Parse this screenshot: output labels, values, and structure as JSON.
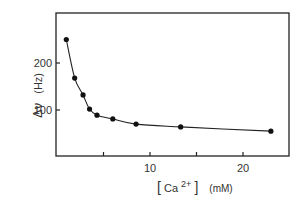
{
  "chart_data": {
    "type": "line",
    "title": "",
    "xlabel": "[Ca2+] (mM)",
    "ylabel": "Δν (Hz)",
    "x_label_parts": {
      "bracket_open": "[",
      "species": "Ca",
      "charge": "2+",
      "bracket_close": "]",
      "unit": "(mM)"
    },
    "y_label_parts": {
      "symbol": "Δν",
      "unit": "(Hz)"
    },
    "xlim": [
      0,
      25
    ],
    "ylim": [
      0,
      305
    ],
    "x_ticks": [
      5,
      10,
      15,
      20
    ],
    "x_tick_labels": [
      "10",
      "20"
    ],
    "x_tick_label_values": [
      10,
      20
    ],
    "y_ticks": [
      100,
      200
    ],
    "y_tick_labels": [
      "100",
      "200"
    ],
    "grid": false,
    "legend": null,
    "series": [
      {
        "name": "Δν vs [Ca2+]",
        "marker": "filled-circle",
        "line": "smooth",
        "x": [
          1.0,
          1.9,
          2.8,
          3.5,
          4.3,
          6.0,
          8.5,
          13.3,
          23.0
        ],
        "values": [
          250,
          168,
          132,
          102,
          89,
          81,
          70,
          64,
          55
        ]
      }
    ]
  }
}
